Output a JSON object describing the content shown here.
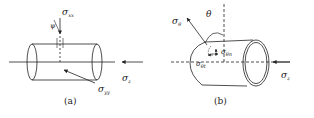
{
  "figure": {
    "panels": [
      {
        "caption": "(a)",
        "labels": {
          "sigma_xx": {
            "main": "σ",
            "sub": "xx"
          },
          "psi": "ψ",
          "sigma_z": {
            "main": "σ",
            "sub": "z"
          },
          "sigma_yy": {
            "main": "σ",
            "sub": "yy"
          }
        }
      },
      {
        "caption": "(b)",
        "labels": {
          "sigma_theta": {
            "main": "σ",
            "sub": "θ"
          },
          "theta": "θ",
          "sigma_thetan": {
            "main": "σ",
            "sub": "θn"
          },
          "sigma_thetat": {
            "main": "σ",
            "sub": "θt"
          },
          "sigma_z": {
            "main": "σ",
            "sub": "z"
          }
        }
      }
    ],
    "colors": {
      "stroke": "#222222",
      "background": "#ffffff"
    }
  }
}
